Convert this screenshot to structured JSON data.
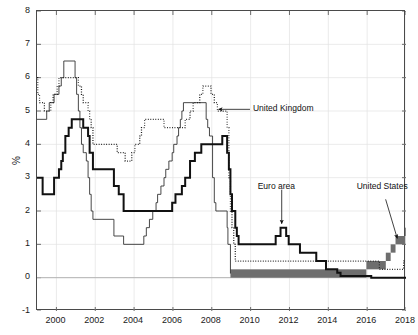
{
  "chart_data": {
    "type": "line",
    "title": "",
    "subtitle": "",
    "xlabel": "",
    "ylabel": "%",
    "xlim": [
      1999.0,
      2018.0
    ],
    "ylim": [
      -1,
      8
    ],
    "grid": true,
    "legend_position": "inline-annotations",
    "yticks": [
      -1,
      0,
      1,
      2,
      3,
      4,
      5,
      6,
      7,
      8
    ],
    "ytick_labels": [
      "-1",
      "0",
      "1",
      "2",
      "3",
      "4",
      "5",
      "6",
      "7",
      "8"
    ],
    "xticks": [
      2000,
      2002,
      2004,
      2006,
      2008,
      2010,
      2012,
      2014,
      2016,
      2018
    ],
    "xtick_labels": [
      "2000",
      "2002",
      "2004",
      "2006",
      "2008",
      "2010",
      "2012",
      "2014",
      "2016",
      "2018"
    ],
    "annotations": [
      {
        "name": "united-kingdom",
        "text": "United Kingdom",
        "x": 2011.1,
        "y": 5.05,
        "arrow_to_x": 2008.35,
        "arrow_to_y": 5.05
      },
      {
        "name": "euro-area",
        "text": "Euro area",
        "x": 2011.6,
        "y": 2.55,
        "arrow_to_x": 2011.6,
        "arrow_to_y": 1.62
      },
      {
        "name": "united-states",
        "text": "United States",
        "x": 2016.9,
        "y": 2.62,
        "arrow_to_x": 2017.55,
        "arrow_to_y": 1.18
      }
    ],
    "series": [
      {
        "name": "United States",
        "style": "solid-thin-and-band",
        "color": "#333333",
        "band_color": "#6e6e6e",
        "note": "Federal funds target; from Dec-2008 a target range drawn as a shaded band",
        "points": [
          [
            1999.0,
            4.75
          ],
          [
            1999.5,
            5.0
          ],
          [
            1999.63,
            5.25
          ],
          [
            1999.88,
            5.5
          ],
          [
            2000.13,
            5.75
          ],
          [
            2000.25,
            6.0
          ],
          [
            2000.38,
            6.5
          ],
          [
            2000.96,
            6.0
          ],
          [
            2001.04,
            5.5
          ],
          [
            2001.13,
            5.0
          ],
          [
            2001.21,
            4.5
          ],
          [
            2001.29,
            4.0
          ],
          [
            2001.38,
            3.75
          ],
          [
            2001.46,
            3.75
          ],
          [
            2001.54,
            3.5
          ],
          [
            2001.63,
            3.0
          ],
          [
            2001.71,
            2.5
          ],
          [
            2001.79,
            2.0
          ],
          [
            2001.88,
            1.75
          ],
          [
            2002.96,
            1.25
          ],
          [
            2003.46,
            1.0
          ],
          [
            2004.5,
            1.25
          ],
          [
            2004.63,
            1.5
          ],
          [
            2004.79,
            1.75
          ],
          [
            2004.96,
            2.0
          ],
          [
            2005.13,
            2.25
          ],
          [
            2005.21,
            2.5
          ],
          [
            2005.38,
            2.75
          ],
          [
            2005.54,
            3.0
          ],
          [
            2005.63,
            3.25
          ],
          [
            2005.79,
            3.5
          ],
          [
            2005.96,
            3.75
          ],
          [
            2006.04,
            4.0
          ],
          [
            2006.21,
            4.25
          ],
          [
            2006.29,
            4.5
          ],
          [
            2006.38,
            4.75
          ],
          [
            2006.46,
            5.0
          ],
          [
            2006.54,
            5.25
          ],
          [
            2007.71,
            4.75
          ],
          [
            2007.79,
            4.5
          ],
          [
            2007.88,
            4.25
          ],
          [
            2008.04,
            3.0
          ],
          [
            2008.13,
            2.25
          ],
          [
            2008.21,
            2.0
          ],
          [
            2008.38,
            2.0
          ],
          [
            2008.79,
            1.5
          ],
          [
            2008.83,
            1.0
          ],
          [
            2008.96,
            0.125
          ]
        ],
        "band_points": [
          [
            2008.96,
            0.0,
            0.25
          ],
          [
            2015.96,
            0.25,
            0.5
          ],
          [
            2016.96,
            0.5,
            0.75
          ],
          [
            2017.21,
            0.75,
            1.0
          ],
          [
            2017.46,
            1.0,
            1.25
          ],
          [
            2017.96,
            1.25,
            1.5
          ],
          [
            2018.0,
            1.25,
            1.5
          ]
        ]
      },
      {
        "name": "United Kingdom",
        "style": "dotted",
        "color": "#1c1c1c",
        "note": "Bank of England Bank Rate",
        "points": [
          [
            1999.0,
            6.0
          ],
          [
            1999.04,
            5.5
          ],
          [
            1999.13,
            5.25
          ],
          [
            1999.29,
            5.25
          ],
          [
            1999.38,
            5.0
          ],
          [
            1999.71,
            5.25
          ],
          [
            1999.83,
            5.5
          ],
          [
            1999.96,
            5.5
          ],
          [
            2000.04,
            5.75
          ],
          [
            2000.13,
            6.0
          ],
          [
            2000.96,
            6.0
          ],
          [
            2001.13,
            5.75
          ],
          [
            2001.29,
            5.5
          ],
          [
            2001.38,
            5.25
          ],
          [
            2001.54,
            5.25
          ],
          [
            2001.63,
            5.0
          ],
          [
            2001.71,
            4.75
          ],
          [
            2001.79,
            4.5
          ],
          [
            2001.88,
            4.0
          ],
          [
            2003.13,
            3.75
          ],
          [
            2003.54,
            3.5
          ],
          [
            2003.88,
            3.75
          ],
          [
            2004.04,
            4.0
          ],
          [
            2004.29,
            4.25
          ],
          [
            2004.38,
            4.5
          ],
          [
            2004.54,
            4.75
          ],
          [
            2005.54,
            4.5
          ],
          [
            2006.63,
            4.75
          ],
          [
            2006.88,
            5.0
          ],
          [
            2007.04,
            5.25
          ],
          [
            2007.38,
            5.5
          ],
          [
            2007.54,
            5.75
          ],
          [
            2007.96,
            5.5
          ],
          [
            2008.13,
            5.25
          ],
          [
            2008.29,
            5.0
          ],
          [
            2008.79,
            4.5
          ],
          [
            2008.88,
            3.0
          ],
          [
            2008.96,
            2.0
          ],
          [
            2009.04,
            1.5
          ],
          [
            2009.13,
            1.0
          ],
          [
            2009.21,
            0.5
          ],
          [
            2016.63,
            0.25
          ],
          [
            2017.88,
            0.5
          ],
          [
            2018.0,
            0.5
          ]
        ]
      },
      {
        "name": "Euro area",
        "style": "solid-thick",
        "color": "#111111",
        "note": "ECB main refinancing rate",
        "points": [
          [
            1999.0,
            3.0
          ],
          [
            1999.29,
            2.5
          ],
          [
            1999.88,
            3.0
          ],
          [
            2000.13,
            3.25
          ],
          [
            2000.25,
            3.5
          ],
          [
            2000.33,
            3.75
          ],
          [
            2000.46,
            4.25
          ],
          [
            2000.63,
            4.5
          ],
          [
            2000.79,
            4.75
          ],
          [
            2001.38,
            4.5
          ],
          [
            2001.63,
            4.25
          ],
          [
            2001.71,
            3.75
          ],
          [
            2001.88,
            3.25
          ],
          [
            2002.96,
            2.75
          ],
          [
            2003.21,
            2.5
          ],
          [
            2003.46,
            2.0
          ],
          [
            2005.96,
            2.25
          ],
          [
            2006.13,
            2.5
          ],
          [
            2006.46,
            2.75
          ],
          [
            2006.63,
            3.0
          ],
          [
            2006.88,
            3.5
          ],
          [
            2007.13,
            3.75
          ],
          [
            2007.46,
            4.0
          ],
          [
            2008.54,
            4.25
          ],
          [
            2008.79,
            3.75
          ],
          [
            2008.88,
            3.25
          ],
          [
            2008.96,
            2.5
          ],
          [
            2009.04,
            2.0
          ],
          [
            2009.21,
            1.5
          ],
          [
            2009.29,
            1.25
          ],
          [
            2009.38,
            1.0
          ],
          [
            2011.29,
            1.25
          ],
          [
            2011.54,
            1.5
          ],
          [
            2011.83,
            1.25
          ],
          [
            2011.96,
            1.0
          ],
          [
            2012.54,
            0.75
          ],
          [
            2013.38,
            0.5
          ],
          [
            2013.88,
            0.25
          ],
          [
            2014.46,
            0.15
          ],
          [
            2014.63,
            0.05
          ],
          [
            2016.21,
            0.0
          ],
          [
            2018.0,
            0.0
          ]
        ]
      }
    ]
  }
}
